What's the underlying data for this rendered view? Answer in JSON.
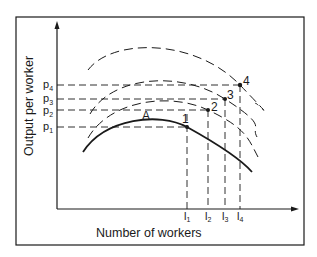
{
  "diagram": {
    "x_axis_label": "Number of workers",
    "y_axis_label": "Output per worker",
    "y_ticks": [
      {
        "label": "p",
        "sub": "4",
        "y": 85
      },
      {
        "label": "p",
        "sub": "3",
        "y": 99
      },
      {
        "label": "p",
        "sub": "2",
        "y": 110
      },
      {
        "label": "p",
        "sub": "1",
        "y": 127
      }
    ],
    "x_ticks": [
      {
        "label": "l",
        "sub": "1",
        "x": 187
      },
      {
        "label": "l",
        "sub": "2",
        "x": 208
      },
      {
        "label": "l",
        "sub": "3",
        "x": 225
      },
      {
        "label": "l",
        "sub": "4",
        "x": 240
      }
    ],
    "curve_label": "A",
    "points": [
      {
        "label": "1",
        "x": 187,
        "y": 127,
        "curve": "solid"
      },
      {
        "label": "2",
        "x": 208,
        "y": 110,
        "curve": "dashed"
      },
      {
        "label": "3",
        "x": 225,
        "y": 99,
        "curve": "dashed"
      },
      {
        "label": "4",
        "x": 240,
        "y": 85,
        "curve": "dashed"
      }
    ],
    "curves": [
      {
        "name": "curve-A",
        "style": "solid"
      },
      {
        "name": "curve-2",
        "style": "dashed"
      },
      {
        "name": "curve-3",
        "style": "dashed"
      },
      {
        "name": "curve-4",
        "style": "dashed"
      }
    ],
    "colors": {
      "ink": "#1a1a1a",
      "background": "#ffffff"
    }
  }
}
